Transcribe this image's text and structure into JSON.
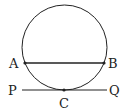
{
  "diagram": {
    "type": "circle-chord-tangent",
    "circle": {
      "cx": 64.5,
      "cy": 47.5,
      "r": 42.5
    },
    "chord": {
      "from": "A",
      "to": "B"
    },
    "tangent": {
      "from": "P",
      "to": "Q",
      "touch_point": "C"
    },
    "points": {
      "A": {
        "label": "A",
        "x": 25,
        "y": 63
      },
      "B": {
        "label": "B",
        "x": 104,
        "y": 63
      },
      "C": {
        "label": "C",
        "x": 64,
        "y": 90
      },
      "P": {
        "label": "P",
        "x": 22,
        "y": 90
      },
      "Q": {
        "label": "Q",
        "x": 107,
        "y": 90
      }
    },
    "colors": {
      "stroke": "#222222",
      "background": "#ffffff"
    }
  }
}
